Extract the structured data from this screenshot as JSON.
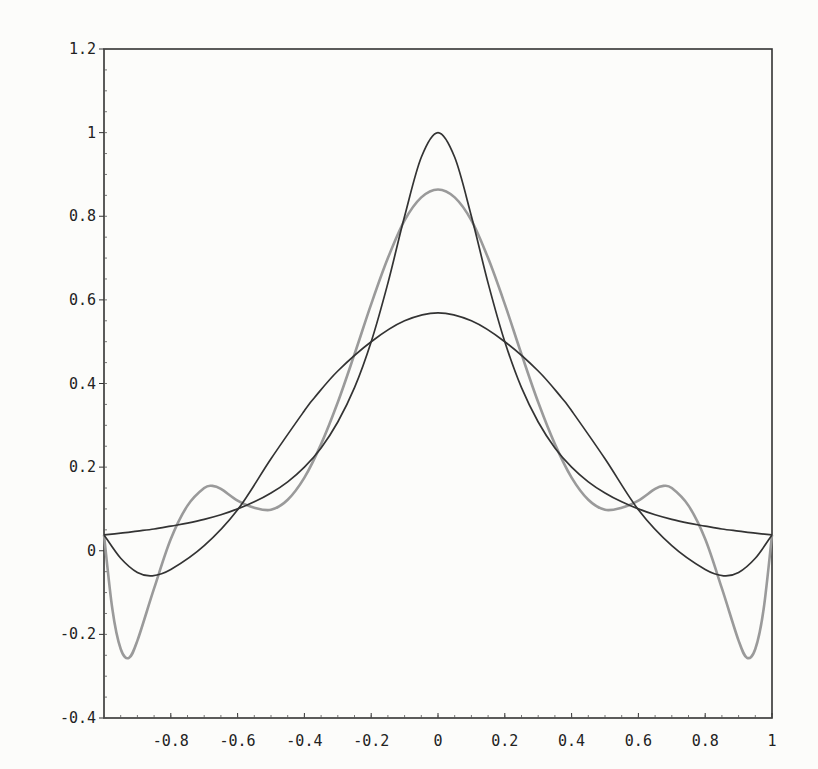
{
  "chart_data": {
    "type": "line",
    "title": "",
    "xlabel": "",
    "ylabel": "",
    "xlim": [
      -1,
      1
    ],
    "ylim": [
      -0.4,
      1.2
    ],
    "grid": false,
    "legend": null,
    "x_ticks": [
      "-0.8",
      "-0.6",
      "-0.4",
      "-0.2",
      "0",
      "0.2",
      "0.4",
      "0.6",
      "0.8",
      "1"
    ],
    "x_tick_values": [
      -0.8,
      -0.6,
      -0.4,
      -0.2,
      0,
      0.2,
      0.4,
      0.6,
      0.8,
      1
    ],
    "y_ticks": [
      "1.2",
      "1",
      "0.8",
      "0.6",
      "0.4",
      "0.2",
      "0",
      "-0.2",
      "-0.4"
    ],
    "y_tick_values": [
      1.2,
      1,
      0.8,
      0.6,
      0.4,
      0.2,
      0,
      -0.2,
      -0.4
    ],
    "series": [
      {
        "name": "runge-function",
        "color": "#333333",
        "x": [
          0,
          0.05,
          0.1,
          0.15,
          0.2,
          0.25,
          0.3,
          0.35,
          0.4,
          0.45,
          0.5,
          0.55,
          0.6,
          0.65,
          0.7,
          0.75,
          0.8,
          0.85,
          0.9,
          0.95,
          1.0
        ],
        "values": [
          1.0,
          0.941,
          0.8,
          0.64,
          0.5,
          0.39,
          0.308,
          0.246,
          0.2,
          0.165,
          0.138,
          0.117,
          0.1,
          0.086,
          0.075,
          0.066,
          0.059,
          0.052,
          0.047,
          0.042,
          0.038
        ],
        "symmetric": true
      },
      {
        "name": "high-degree-interpolant",
        "color": "#9a9a9a",
        "x": [
          0,
          0.05,
          0.1,
          0.15,
          0.2,
          0.25,
          0.3,
          0.35,
          0.4,
          0.45,
          0.5,
          0.55,
          0.6,
          0.65,
          0.675,
          0.7,
          0.75,
          0.8,
          0.85,
          0.9,
          0.925,
          0.95,
          0.975,
          1.0
        ],
        "values": [
          0.864,
          0.845,
          0.79,
          0.7,
          0.59,
          0.47,
          0.355,
          0.255,
          0.175,
          0.122,
          0.098,
          0.103,
          0.12,
          0.148,
          0.155,
          0.15,
          0.108,
          0.028,
          -0.09,
          -0.215,
          -0.256,
          -0.235,
          -0.14,
          0.038
        ],
        "symmetric": true
      },
      {
        "name": "low-degree-approximant",
        "color": "#333333",
        "x": [
          0,
          0.1,
          0.2,
          0.3,
          0.37,
          0.4,
          0.5,
          0.6,
          0.7,
          0.8,
          0.855,
          0.9,
          0.95,
          1.0
        ],
        "values": [
          0.569,
          0.55,
          0.5,
          0.43,
          0.366,
          0.335,
          0.22,
          0.098,
          0.012,
          -0.045,
          -0.06,
          -0.052,
          -0.018,
          0.038
        ],
        "symmetric": true
      }
    ]
  },
  "colors": {
    "axis": "#333333",
    "background": "#fcfcfa"
  }
}
